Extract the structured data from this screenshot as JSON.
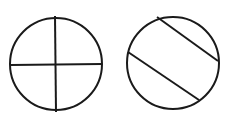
{
  "canvas": {
    "width": 232,
    "height": 120,
    "background": "#ffffff"
  },
  "style": {
    "stroke": "#1a1a1a",
    "stroke_width": 2
  },
  "figures": [
    {
      "name": "circle-quartered",
      "description": "Circle divided into four equal parts by a vertical and a horizontal diameter",
      "circle": {
        "cx": 56,
        "cy": 64,
        "r": 46
      },
      "lines": [
        {
          "x1": 55,
          "y1": 16,
          "x2": 56,
          "y2": 112
        },
        {
          "x1": 11,
          "y1": 65,
          "x2": 102,
          "y2": 64
        }
      ]
    },
    {
      "name": "circle-parallel-chords",
      "description": "Circle divided into three parts by two parallel diagonal chords",
      "circle": {
        "cx": 173,
        "cy": 63,
        "r": 46
      },
      "lines": [
        {
          "x1": 157,
          "y1": 17,
          "x2": 218,
          "y2": 61
        },
        {
          "x1": 128,
          "y1": 52,
          "x2": 199,
          "y2": 100
        }
      ]
    }
  ]
}
